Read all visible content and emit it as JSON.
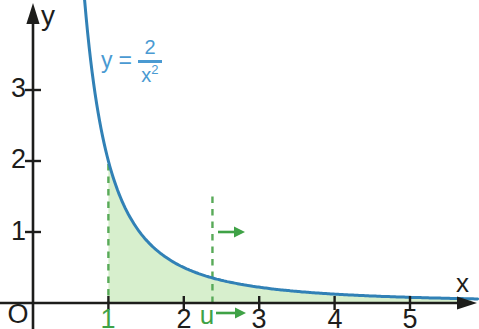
{
  "chart": {
    "colors": {
      "background": "#ffffff",
      "axis": "#1d1d1b",
      "curve": "#3181b6",
      "formula": "#4a9ad2",
      "green_accent": "#3fa246",
      "dashed_green": "#58aa58",
      "shade_fill": "#d7efcd"
    },
    "y_axis_label": "y",
    "x_axis_label": "x",
    "origin_label": "O",
    "u_label": "u",
    "formula": {
      "lhs": "y",
      "eq": "=",
      "numerator": "2",
      "denominator_base": "x",
      "denominator_exponent": "2"
    }
  },
  "chart_data": {
    "type": "line",
    "expression": "y = 2 / x^2",
    "coefficient": 2,
    "exponent": 2,
    "xlabel": "x",
    "ylabel": "y",
    "xlim": [
      0,
      5.9
    ],
    "ylim": [
      0,
      4.3
    ],
    "grid": false,
    "x_ticks": [
      {
        "value": 1,
        "label": "1",
        "accent": true
      },
      {
        "value": 2,
        "label": "2"
      },
      {
        "value": 3,
        "label": "3"
      },
      {
        "value": 4,
        "label": "4"
      },
      {
        "value": 5,
        "label": "5"
      }
    ],
    "y_ticks": [
      {
        "value": 1,
        "label": "1"
      },
      {
        "value": 2,
        "label": "2"
      },
      {
        "value": 3,
        "label": "3"
      }
    ],
    "shaded_region": {
      "from_x": 1,
      "to_x": "unbounded (extends to right edge)",
      "u_marker": 2.38,
      "u_guide_top_y": 1.5,
      "note": "green area under curve from x=1 to moving bound u; green arrows show u increasing to the right"
    },
    "samples": [
      [
        0.7,
        4.08
      ],
      [
        0.8,
        3.13
      ],
      [
        0.9,
        2.47
      ],
      [
        1.0,
        2.0
      ],
      [
        1.2,
        1.39
      ],
      [
        1.4,
        1.02
      ],
      [
        1.6,
        0.78
      ],
      [
        1.8,
        0.62
      ],
      [
        2.0,
        0.5
      ],
      [
        2.4,
        0.35
      ],
      [
        2.8,
        0.26
      ],
      [
        3.0,
        0.22
      ],
      [
        3.5,
        0.16
      ],
      [
        4.0,
        0.13
      ],
      [
        4.5,
        0.1
      ],
      [
        5.0,
        0.08
      ],
      [
        5.5,
        0.07
      ],
      [
        5.9,
        0.06
      ]
    ]
  }
}
